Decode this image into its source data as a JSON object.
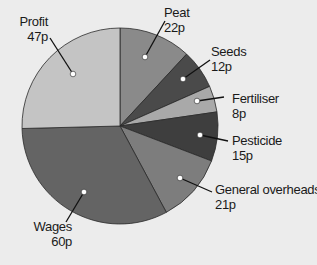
{
  "chart_data": {
    "type": "pie",
    "title": "",
    "unit": "p",
    "total": 185,
    "start_angle_deg": 0,
    "direction": "clockwise",
    "slices": [
      {
        "label": "Peat",
        "value": 22,
        "display": "22p",
        "color": "#8a8a8a"
      },
      {
        "label": "Seeds",
        "value": 12,
        "display": "12p",
        "color": "#4a4a4a"
      },
      {
        "label": "Fertiliser",
        "value": 8,
        "display": "8p",
        "color": "#a9a9a9"
      },
      {
        "label": "Pesticide",
        "value": 15,
        "display": "15p",
        "color": "#3e3e3e"
      },
      {
        "label": "General overheads",
        "value": 21,
        "display": "21p",
        "color": "#7d7d7d"
      },
      {
        "label": "Wages",
        "value": 60,
        "display": "60p",
        "color": "#646464"
      },
      {
        "label": "Profit",
        "value": 47,
        "display": "47p",
        "color": "#c4c4c4"
      }
    ],
    "legend": "none (callout labels with leader lines)"
  },
  "labels": {
    "peat": {
      "name": "Peat",
      "value": "22p"
    },
    "seeds": {
      "name": "Seeds",
      "value": "12p"
    },
    "fertiliser": {
      "name": "Fertiliser",
      "value": "8p"
    },
    "pesticide": {
      "name": "Pesticide",
      "value": "15p"
    },
    "overheads": {
      "name": "General overheads",
      "value": "21p"
    },
    "wages": {
      "name": "Wages",
      "value": "60p"
    },
    "profit": {
      "name": "Profit",
      "value": "47p"
    }
  }
}
